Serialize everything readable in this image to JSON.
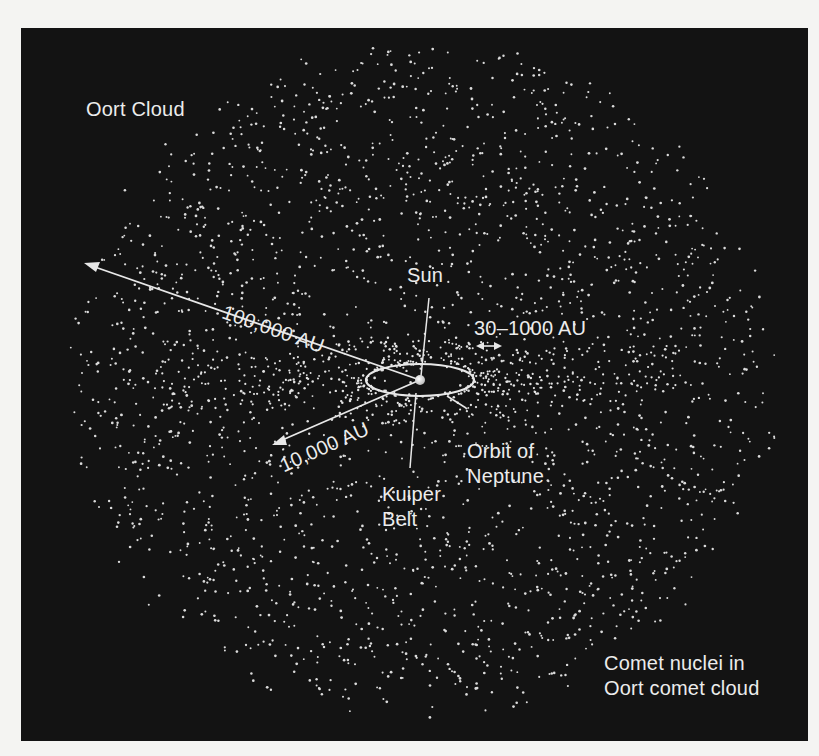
{
  "diagram": {
    "title": "Oort Cloud",
    "labels": {
      "oort_cloud": "Oort Cloud",
      "sun": "Sun",
      "distance_outer": "100,000 AU",
      "distance_inner": "10,000 AU",
      "kuiper_range": "30–1000 AU",
      "orbit_line1": "Orbit of",
      "orbit_line2": "Neptune",
      "kuiper_line1": "Kuiper",
      "kuiper_line2": "Belt",
      "comet_line1": "Comet nuclei in",
      "comet_line2": "Oort comet cloud"
    },
    "colors": {
      "background": "#131313",
      "foreground": "#ececec",
      "page": "#f4f4f2"
    },
    "geometry": {
      "sun_center": [
        420,
        380
      ],
      "neptune_orbit_rx": 54,
      "neptune_orbit_ry": 16,
      "oort_cloud_rx": 365,
      "oort_cloud_ry": 348,
      "inner_cloud_rx": 215,
      "inner_cloud_ry": 175
    }
  }
}
